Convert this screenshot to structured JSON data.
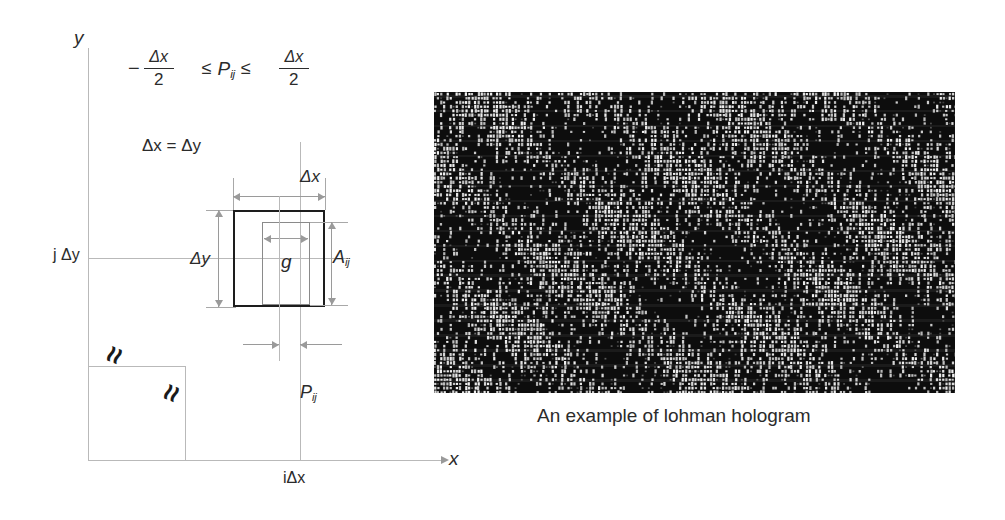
{
  "diagram": {
    "axes": {
      "y_label": "y",
      "x_label": "x",
      "y_tick_label": "j Δy",
      "x_tick_label": "iΔx"
    },
    "formula": {
      "minus": "−",
      "numerator": "Δx",
      "denominator": "2",
      "relation_left": "≤",
      "variable": "P",
      "variable_sub": "ij",
      "relation_right": "≤",
      "numerator2": "Δx",
      "denominator2": "2",
      "full_text": "−Δx/2 ≤ P_ij ≤ Δx/2"
    },
    "equality": "Δx = Δy",
    "labels": {
      "cell_width": "Δx",
      "cell_height": "Δy",
      "aperture_width": "g",
      "aperture_area": "A",
      "aperture_area_sub": "ij",
      "offset": "P",
      "offset_sub": "ij"
    },
    "break_marks": [
      {
        "name": "break-mark-horizontal",
        "symbol": "≈"
      },
      {
        "name": "break-mark-vertical",
        "symbol": "≈"
      }
    ]
  },
  "hologram": {
    "caption": "An example of lohman hologram",
    "background_color": "#0d0d0d",
    "cell_color": "#d8d8d8",
    "width": 521,
    "height": 301
  },
  "colors": {
    "ink": "#2b2b2b",
    "thick_line": "#1d1d1d",
    "thin_line": "#8a8a8a",
    "grid_line": "#b9b9b9",
    "dim_line": "#9a9a9a"
  }
}
